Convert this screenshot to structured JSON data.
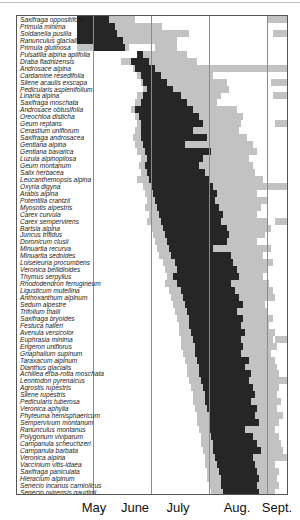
{
  "chart_data": {
    "type": "bar",
    "subtype": "horizontal-range (flowering phenology)",
    "title": "",
    "xlabel": "",
    "ylabel": "",
    "x_ticks": [
      "May",
      "June",
      "July",
      "Aug.",
      "Sept."
    ],
    "grid": "vertical month dividers",
    "legend": "none (dark = main/peak flowering period, light gray = total flowering range)",
    "units": "months (fractional, 5.0 = start of May, 6.0 = start of June, ... 9.0 = start of Sept.)",
    "species": [
      "Saxifraga oppositifolia",
      "Primula minima",
      "Soldanella pusilla",
      "Ranunculus glacialis",
      "Primula glutinosa",
      "Pulsatilla alpina apiifolia",
      "Draba fladnizensis",
      "Androsace alpina",
      "Cardamine resedifolia",
      "Silene acaulis exscapa",
      "Pedicularis asplenifolium",
      "Linaria alpina",
      "Saxifraga moschata",
      "Androsace obtusifolia",
      "Oreochloa disticha",
      "Geum reptans",
      "Cerastium uniflorum",
      "Saxifraga androsacea",
      "Gentiana alpina",
      "Gentiana bavarica",
      "Luzula alpinopilosa",
      "Geum montanum",
      "Salix herbacea",
      "Leucanthemopsis alpina",
      "Oxyria digyna",
      "Arabis alpina",
      "Potentilla crantzii",
      "Myosotis alpestris",
      "Carex curvula",
      "Carex sempervirens",
      "Bartsia alpina",
      "Juncus trifidus",
      "Doronicum clusii",
      "Minuartia recurva",
      "Minuartia sedoides",
      "Loiseleuria procumbens",
      "Veronica bellidioides",
      "Thymus serpyllus",
      "Rhododendron ferrugineum",
      "Ligusticum mutellina",
      "Anthoxanthum alpinum",
      "Sedum alpestre",
      "Trifolium thalii",
      "Saxifraga bryoides",
      "Festuca halleri",
      "Avenula versicolor",
      "Euphrasia minima",
      "Erigeron uniflorus",
      "Gnaphalium supinum",
      "Taraxacum alpinum",
      "Dianthus glacialis",
      "Achillea erba-rotta moschata",
      "Leontodon pyrenaicus",
      "Agrostis rupestris",
      "Silene rupestris",
      "Pedicularis tuberosa",
      "Veronica aphylla",
      "Phyteuma hemisphaericum",
      "Sempervivum montanum",
      "Ranunculus montanus",
      "Polygonum viviparum",
      "Campanula scheuchzeri",
      "Campanula barbata",
      "Veronica alpina",
      "Vaccinium vitis-idaea",
      "Saxifraga paniculata",
      "Hieracium alpinum",
      "Senecio incanus carniolicus",
      "Senecio ovirensis gaudinii",
      "Cirsium spinosissimum",
      "Cerastium cerastoides",
      "Gentianella tenella"
    ],
    "series": [
      {
        "name": "total flowering range",
        "style": "light gray"
      },
      {
        "name": "main flowering period",
        "style": "dark"
      }
    ],
    "note": "Bar extents per species are stored in the `rows` array in pixel units of the plot area; month boundaries at plot x = 76 (June), 134 (July), 192 (Aug.), 250 (Sept.)"
  },
  "layout": {
    "month_x": [
      76,
      134,
      192,
      250
    ],
    "row_height": 6.95,
    "colors": {
      "dark": "#262626",
      "light": "#c2c2c2",
      "grid": "#8c8c8c",
      "frame": "#555555"
    }
  },
  "axis": {
    "months": [
      {
        "label": "May",
        "x": 94
      },
      {
        "label": "June",
        "x": 135
      },
      {
        "label": "July",
        "x": 178
      },
      {
        "label": "Aug.",
        "x": 237
      },
      {
        "label": "Sept.",
        "x": 277
      }
    ]
  },
  "rows": [
    {
      "l": [
        [
          60,
          118
        ],
        [
          250,
          270
        ]
      ],
      "d": [
        [
          60,
          92
        ]
      ]
    },
    {
      "l": [
        [
          60,
          145
        ]
      ],
      "d": [
        [
          60,
          98
        ]
      ]
    },
    {
      "l": [
        [
          60,
          150
        ],
        [
          138,
          172
        ],
        [
          256,
          272
        ]
      ],
      "d": [
        [
          60,
          100
        ]
      ]
    },
    {
      "l": [
        [
          60,
          160
        ]
      ],
      "d": [
        [
          60,
          106
        ]
      ]
    },
    {
      "l": [
        [
          60,
          112
        ],
        [
          138,
          160
        ]
      ],
      "d": [
        [
          76,
          108
        ]
      ]
    },
    {
      "l": [
        [
          120,
          170
        ]
      ],
      "d": [
        [
          126,
          120
        ]
      ]
    },
    {
      "l": [
        [
          104,
          180
        ]
      ],
      "d": [
        [
          114,
          132
        ]
      ]
    },
    {
      "l": [
        [
          116,
          190
        ],
        [
          178,
          272
        ]
      ],
      "d": [
        [
          118,
          138
        ]
      ]
    },
    {
      "l": [
        [
          120,
          196
        ]
      ],
      "d": [
        [
          124,
          144
        ]
      ]
    },
    {
      "l": [
        [
          124,
          210
        ],
        [
          254,
          272
        ]
      ],
      "d": [
        [
          126,
          150
        ]
      ]
    },
    {
      "l": [
        [
          126,
          212
        ]
      ],
      "d": [
        [
          130,
          156
        ]
      ]
    },
    {
      "l": [
        [
          120,
          204
        ],
        [
          256,
          272
        ]
      ],
      "d": [
        [
          126,
          164
        ]
      ]
    },
    {
      "l": [
        [
          118,
          200
        ]
      ],
      "d": [
        [
          124,
          170
        ]
      ]
    },
    {
      "l": [
        [
          114,
          220
        ]
      ],
      "d": [
        [
          118,
          176
        ]
      ]
    },
    {
      "l": [
        [
          118,
          226
        ]
      ],
      "d": [
        [
          122,
          182
        ]
      ]
    },
    {
      "l": [
        [
          120,
          224
        ],
        [
          258,
          272
        ]
      ],
      "d": [
        [
          124,
          186
        ]
      ]
    },
    {
      "l": [
        [
          118,
          222
        ]
      ],
      "d": [
        [
          124,
          176
        ]
      ]
    },
    {
      "l": [
        [
          116,
          230
        ]
      ],
      "d": [
        [
          124,
          190
        ]
      ]
    },
    {
      "l": [
        [
          118,
          236
        ]
      ],
      "d": [
        [
          126,
          168
        ]
      ]
    },
    {
      "l": [
        [
          120,
          240
        ]
      ],
      "d": [
        [
          128,
          194
        ]
      ]
    },
    {
      "l": [
        [
          124,
          232
        ]
      ],
      "d": [
        [
          130,
          186
        ]
      ]
    },
    {
      "l": [
        [
          122,
          236
        ]
      ],
      "d": [
        [
          128,
          182
        ]
      ]
    },
    {
      "l": [
        [
          124,
          238
        ]
      ],
      "d": [
        [
          130,
          188
        ]
      ]
    },
    {
      "l": [
        [
          120,
          246
        ]
      ],
      "d": [
        [
          132,
          192
        ]
      ]
    },
    {
      "l": [
        [
          126,
          272
        ]
      ],
      "d": [
        [
          134,
          196
        ]
      ]
    },
    {
      "l": [
        [
          128,
          240
        ]
      ],
      "d": [
        [
          136,
          200
        ]
      ]
    },
    {
      "l": [
        [
          130,
          250
        ]
      ],
      "d": [
        [
          138,
          198
        ]
      ]
    },
    {
      "l": [
        [
          128,
          244
        ]
      ],
      "d": [
        [
          140,
          202
        ]
      ]
    },
    {
      "l": [
        [
          132,
          240
        ]
      ],
      "d": [
        [
          142,
          206
        ]
      ]
    },
    {
      "l": [
        [
          130,
          250
        ],
        [
          258,
          272
        ]
      ],
      "d": [
        [
          144,
          204
        ]
      ]
    },
    {
      "l": [
        [
          134,
          254
        ]
      ],
      "d": [
        [
          146,
          210
        ]
      ]
    },
    {
      "l": [
        [
          136,
          248
        ]
      ],
      "d": [
        [
          148,
          212
        ]
      ]
    },
    {
      "l": [
        [
          138,
          240
        ]
      ],
      "d": [
        [
          150,
          210
        ]
      ]
    },
    {
      "l": [
        [
          140,
          254
        ]
      ],
      "d": [
        [
          152,
          196
        ]
      ]
    },
    {
      "l": [
        [
          142,
          246
        ]
      ],
      "d": [
        [
          154,
          214
        ]
      ]
    },
    {
      "l": [
        [
          146,
          256
        ]
      ],
      "d": [
        [
          158,
          216
        ]
      ]
    },
    {
      "l": [
        [
          148,
          250
        ]
      ],
      "d": [
        [
          160,
          220
        ]
      ]
    },
    {
      "l": [
        [
          150,
          246
        ]
      ],
      "d": [
        [
          156,
          222
        ]
      ]
    },
    {
      "l": [
        [
          148,
          252
        ]
      ],
      "d": [
        [
          160,
          214
        ]
      ]
    },
    {
      "l": [
        [
          152,
          256
        ]
      ],
      "d": [
        [
          164,
          218
        ]
      ]
    },
    {
      "l": [
        [
          154,
          258
        ]
      ],
      "d": [
        [
          166,
          222
        ]
      ]
    },
    {
      "l": [
        [
          156,
          248
        ]
      ],
      "d": [
        [
          168,
          226
        ]
      ]
    },
    {
      "l": [
        [
          158,
          250
        ]
      ],
      "d": [
        [
          170,
          220
        ]
      ]
    },
    {
      "l": [
        [
          160,
          256
        ]
      ],
      "d": [
        [
          172,
          226
        ]
      ]
    },
    {
      "l": [
        [
          162,
          252
        ]
      ],
      "d": [
        [
          172,
          224
        ]
      ]
    },
    {
      "l": [
        [
          162,
          258
        ]
      ],
      "d": [
        [
          174,
          228
        ]
      ]
    },
    {
      "l": [
        [
          164,
          256
        ],
        [
          258,
          272
        ]
      ],
      "d": [
        [
          176,
          224
        ]
      ]
    },
    {
      "l": [
        [
          164,
          260
        ]
      ],
      "d": [
        [
          178,
          226
        ]
      ]
    },
    {
      "l": [
        [
          166,
          254
        ]
      ],
      "d": [
        [
          178,
          224
        ]
      ]
    },
    {
      "l": [
        [
          168,
          258
        ]
      ],
      "d": [
        [
          180,
          232
        ]
      ]
    },
    {
      "l": [
        [
          170,
          260
        ]
      ],
      "d": [
        [
          182,
          228
        ]
      ]
    },
    {
      "l": [
        [
          170,
          262
        ]
      ],
      "d": [
        [
          182,
          234
        ]
      ]
    },
    {
      "l": [
        [
          172,
          256
        ],
        [
          256,
          272
        ]
      ],
      "d": [
        [
          184,
          232
        ]
      ]
    },
    {
      "l": [
        [
          174,
          262
        ]
      ],
      "d": [
        [
          186,
          236
        ]
      ]
    },
    {
      "l": [
        [
          176,
          260
        ]
      ],
      "d": [
        [
          188,
          238
        ]
      ]
    },
    {
      "l": [
        [
          176,
          264
        ]
      ],
      "d": [
        [
          188,
          234
        ]
      ]
    },
    {
      "l": [
        [
          178,
          260
        ]
      ],
      "d": [
        [
          190,
          240
        ]
      ]
    },
    {
      "l": [
        [
          180,
          266
        ]
      ],
      "d": [
        [
          192,
          238
        ]
      ]
    },
    {
      "l": [
        [
          180,
          262
        ]
      ],
      "d": [
        [
          192,
          242
        ]
      ]
    },
    {
      "l": [
        [
          182,
          258
        ]
      ],
      "d": [
        [
          192,
          228
        ]
      ]
    },
    {
      "l": [
        [
          184,
          262
        ]
      ],
      "d": [
        [
          194,
          236
        ]
      ]
    },
    {
      "l": [
        [
          184,
          264
        ]
      ],
      "d": [
        [
          196,
          240
        ]
      ]
    },
    {
      "l": [
        [
          186,
          266
        ]
      ],
      "d": [
        [
          196,
          244
        ]
      ]
    },
    {
      "l": [
        [
          188,
          272
        ]
      ],
      "d": [
        [
          198,
          236
        ]
      ]
    },
    {
      "l": [
        [
          188,
          258
        ]
      ],
      "d": [
        [
          200,
          238
        ]
      ]
    },
    {
      "l": [
        [
          190,
          262
        ]
      ],
      "d": [
        [
          202,
          240
        ]
      ]
    },
    {
      "l": [
        [
          190,
          260
        ]
      ],
      "d": [
        [
          204,
          242
        ]
      ]
    },
    {
      "l": [
        [
          192,
          262
        ]
      ],
      "d": [
        [
          204,
          240
        ]
      ]
    },
    {
      "l": [
        [
          194,
          258
        ]
      ],
      "d": [
        [
          206,
          242
        ]
      ]
    }
  ]
}
